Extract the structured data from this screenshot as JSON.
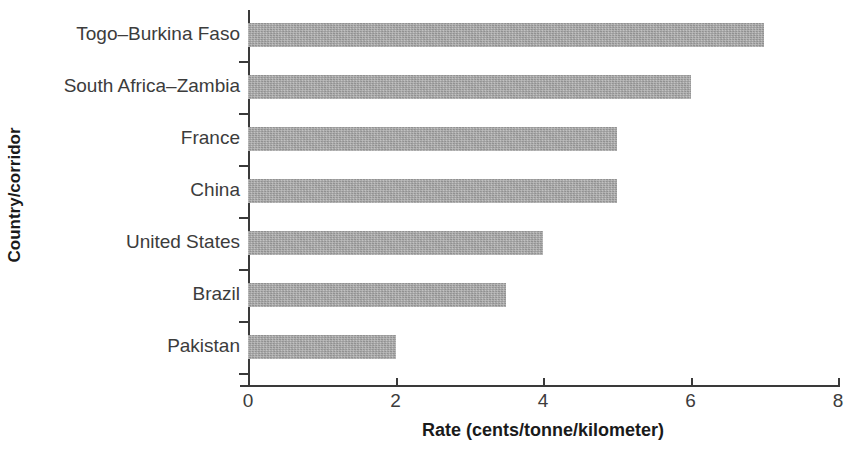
{
  "chart_data": {
    "type": "bar",
    "orientation": "horizontal",
    "title": "",
    "xlabel": "Rate (cents/tonne/kilometer)",
    "ylabel": "Country/corridor",
    "categories": [
      "Togo–Burkina Faso",
      "South Africa–Zambia",
      "France",
      "China",
      "United States",
      "Brazil",
      "Pakistan"
    ],
    "values": [
      7.0,
      6.0,
      5.0,
      5.0,
      4.0,
      3.5,
      2.0
    ],
    "xlim": [
      0,
      8
    ],
    "xticks": [
      0,
      2,
      4,
      6,
      8
    ],
    "xtick_labels": [
      "0",
      "2",
      "4",
      "6",
      "8"
    ],
    "grid": false,
    "legend": null,
    "bar_color": "#a9a9a9",
    "axis_color": "#3a3a3a",
    "text_color": "#3c3c3c"
  }
}
